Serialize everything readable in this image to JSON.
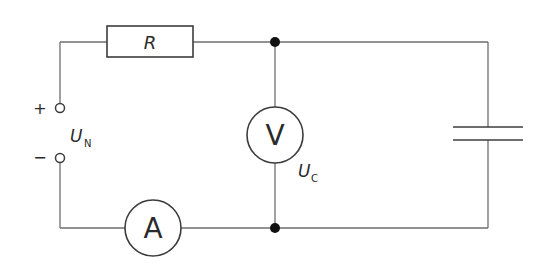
{
  "diagram": {
    "type": "electrical-circuit",
    "components": {
      "resistor": {
        "label": "R"
      },
      "voltmeter": {
        "label": "V",
        "measured_quantity": "U",
        "measured_subscript": "C"
      },
      "ammeter": {
        "label": "A"
      },
      "capacitor": {
        "label": ""
      },
      "source": {
        "label": "U",
        "subscript": "N",
        "plus": "+",
        "minus": "−"
      }
    },
    "colors": {
      "wire": "#6e6e6e",
      "component": "#3c3c3c",
      "junction": "#111111",
      "background": "#ffffff"
    }
  }
}
